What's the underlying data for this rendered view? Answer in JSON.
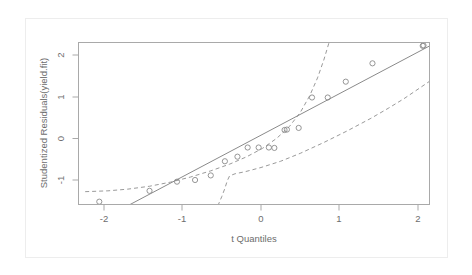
{
  "figure": {
    "type": "qq-plot",
    "renderer": "R graphics device",
    "background": "#ffffff",
    "frame_color": "#a9a9a9"
  },
  "chart_data": {
    "type": "scatter",
    "title": "",
    "xlabel": "t Quantiles",
    "ylabel": "Studentized Residuals(yield.fit)",
    "xlim": [
      -2.25,
      2.25
    ],
    "ylim": [
      -1.62,
      2.32
    ],
    "xticks": [
      "-2",
      "-1",
      "0",
      "1",
      "2"
    ],
    "xtick_values": [
      -2,
      -1,
      0,
      1,
      2
    ],
    "yticks": [
      "-1",
      "0",
      "1",
      "2"
    ],
    "ytick_values": [
      -1,
      0,
      1,
      2
    ],
    "grid": false,
    "legend": "none",
    "point_marker": "open-circle",
    "point_color": "#8a8a8a",
    "line_color": "#8a8a8a",
    "envelope_color": "#9a9a9a",
    "envelope_style": "dashed",
    "n_points": 20,
    "x": [
      -2.06,
      -1.42,
      -1.07,
      -0.84,
      -0.64,
      -0.46,
      -0.3,
      -0.17,
      -0.03,
      0.1,
      0.17,
      0.3,
      0.33,
      0.48,
      0.65,
      0.85,
      1.08,
      1.42,
      2.06,
      2.07
    ],
    "y": [
      -1.52,
      -1.26,
      -1.04,
      -1.0,
      -0.89,
      -0.55,
      -0.44,
      -0.22,
      -0.22,
      -0.22,
      -0.23,
      0.2,
      0.21,
      0.25,
      0.98,
      0.98,
      1.36,
      1.8,
      2.22,
      2.22
    ],
    "points": [
      {
        "x": -2.06,
        "y": -1.52
      },
      {
        "x": -1.42,
        "y": -1.26
      },
      {
        "x": -1.07,
        "y": -1.04
      },
      {
        "x": -0.84,
        "y": -1.0
      },
      {
        "x": -0.64,
        "y": -0.89
      },
      {
        "x": -0.46,
        "y": -0.55
      },
      {
        "x": -0.3,
        "y": -0.44
      },
      {
        "x": -0.17,
        "y": -0.22
      },
      {
        "x": -0.03,
        "y": -0.22
      },
      {
        "x": 0.1,
        "y": -0.22
      },
      {
        "x": 0.17,
        "y": -0.23
      },
      {
        "x": 0.3,
        "y": 0.2
      },
      {
        "x": 0.33,
        "y": 0.21
      },
      {
        "x": 0.48,
        "y": 0.25
      },
      {
        "x": 0.65,
        "y": 0.98
      },
      {
        "x": 0.85,
        "y": 0.98
      },
      {
        "x": 1.08,
        "y": 1.36
      },
      {
        "x": 1.42,
        "y": 1.8
      },
      {
        "x": 2.06,
        "y": 2.22
      },
      {
        "x": 2.07,
        "y": 2.23
      }
    ],
    "reference_line": {
      "name": "qq-reference-line",
      "style": "solid",
      "x_start": -1.7,
      "y_start": -1.62,
      "x_end": 2.24,
      "y_end": 2.31
    },
    "envelope_upper": {
      "name": "upper-confidence-envelope",
      "style": "dashed",
      "points": [
        {
          "x": -2.24,
          "y": -1.28
        },
        {
          "x": -1.95,
          "y": -1.26
        },
        {
          "x": -1.7,
          "y": -1.22
        },
        {
          "x": -1.42,
          "y": -1.15
        },
        {
          "x": -1.15,
          "y": -1.05
        },
        {
          "x": -0.9,
          "y": -0.93
        },
        {
          "x": -0.64,
          "y": -0.78
        },
        {
          "x": -0.4,
          "y": -0.62
        },
        {
          "x": -0.18,
          "y": -0.44
        },
        {
          "x": 0.02,
          "y": -0.24
        },
        {
          "x": 0.2,
          "y": 0.0
        },
        {
          "x": 0.36,
          "y": 0.28
        },
        {
          "x": 0.5,
          "y": 0.62
        },
        {
          "x": 0.62,
          "y": 1.02
        },
        {
          "x": 0.72,
          "y": 1.45
        },
        {
          "x": 0.8,
          "y": 1.88
        },
        {
          "x": 0.87,
          "y": 2.32
        }
      ]
    },
    "envelope_lower": {
      "name": "lower-confidence-envelope",
      "style": "dashed",
      "points": [
        {
          "x": -0.55,
          "y": -1.62
        },
        {
          "x": -0.5,
          "y": -1.4
        },
        {
          "x": -0.46,
          "y": -1.2
        },
        {
          "x": -0.43,
          "y": -1.02
        },
        {
          "x": -0.4,
          "y": -0.9
        },
        {
          "x": -0.33,
          "y": -0.85
        },
        {
          "x": -0.2,
          "y": -0.8
        },
        {
          "x": 0.0,
          "y": -0.7
        },
        {
          "x": 0.25,
          "y": -0.55
        },
        {
          "x": 0.5,
          "y": -0.36
        },
        {
          "x": 0.8,
          "y": -0.1
        },
        {
          "x": 1.1,
          "y": 0.18
        },
        {
          "x": 1.4,
          "y": 0.48
        },
        {
          "x": 1.62,
          "y": 0.72
        },
        {
          "x": 1.82,
          "y": 0.95
        },
        {
          "x": 2.0,
          "y": 1.18
        },
        {
          "x": 2.14,
          "y": 1.36
        },
        {
          "x": 2.24,
          "y": 1.48
        }
      ]
    }
  }
}
